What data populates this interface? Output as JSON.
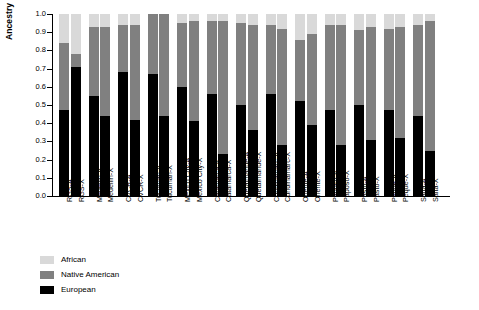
{
  "chart_data": {
    "type": "bar",
    "title": "",
    "xlabel": "",
    "ylabel": "Ancestry Proportion",
    "ylim": [
      0,
      1.0
    ],
    "ytick_labels": [
      "0.0",
      "0.1",
      "0.2",
      "0.3",
      "0.4",
      "0.5",
      "0.6",
      "0.7",
      "0.8",
      "0.9",
      "1.0"
    ],
    "ytick_values": [
      0,
      0.1,
      0.2,
      0.3,
      0.4,
      0.5,
      0.6,
      0.7,
      0.8,
      0.9,
      1.0
    ],
    "grid": false,
    "stacked": true,
    "legend_position": "bottom-left",
    "legend": [
      "African",
      "Native American",
      "European"
    ],
    "colors": {
      "African": "#d9d9d9",
      "Native American": "#808080",
      "European": "#000000"
    },
    "categories": [
      "RGS-A",
      "RGS-X",
      "Medellin-A",
      "Medellin-X",
      "CVCR-A",
      "CVCR-X",
      "Tucuman-A",
      "Tucuman-X",
      "Mexico City-A",
      "Mexico City-X",
      "Catamarca-A",
      "Catamarca-X",
      "Quetalmahue-A",
      "Quetalmahue-X",
      "Cundinamarc-A",
      "Cundinamarc-X",
      "Oriente-A",
      "Oriente-X",
      "Paposo-A",
      "Paposo-X",
      "Pasto-A",
      "Pasto-X",
      "Peque-A",
      "Peque-X",
      "Salta-A",
      "Salta-X"
    ],
    "group_gaps_after": [
      1,
      3,
      5,
      7,
      9,
      11,
      13,
      15,
      17,
      19,
      21,
      23
    ],
    "series": [
      {
        "name": "European",
        "values": [
          0.47,
          0.71,
          0.55,
          0.44,
          0.68,
          0.42,
          0.67,
          0.44,
          0.6,
          0.41,
          0.56,
          0.23,
          0.5,
          0.36,
          0.56,
          0.28,
          0.52,
          0.39,
          0.47,
          0.28,
          0.5,
          0.31,
          0.47,
          0.32,
          0.44,
          0.25
        ]
      },
      {
        "name": "Native American",
        "values": [
          0.37,
          0.07,
          0.38,
          0.49,
          0.26,
          0.52,
          0.33,
          0.56,
          0.35,
          0.55,
          0.4,
          0.73,
          0.45,
          0.58,
          0.38,
          0.64,
          0.34,
          0.5,
          0.47,
          0.66,
          0.41,
          0.62,
          0.45,
          0.61,
          0.5,
          0.71
        ]
      },
      {
        "name": "African",
        "values": [
          0.16,
          0.22,
          0.07,
          0.07,
          0.06,
          0.06,
          0.0,
          0.0,
          0.05,
          0.04,
          0.04,
          0.04,
          0.05,
          0.06,
          0.06,
          0.08,
          0.14,
          0.11,
          0.06,
          0.06,
          0.09,
          0.07,
          0.08,
          0.07,
          0.06,
          0.04
        ]
      }
    ]
  }
}
